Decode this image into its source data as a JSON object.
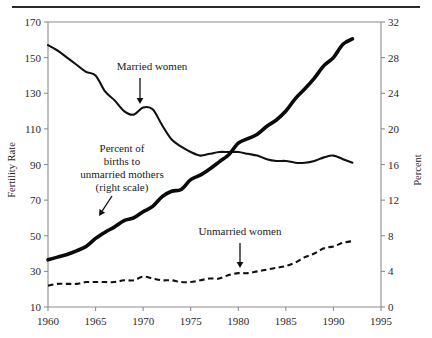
{
  "figure": {
    "top_rule": "horizontal-rule"
  },
  "chart_data": {
    "type": "line",
    "title": "",
    "xlabel": "",
    "ylabel": "Fertility Rate",
    "y2label": "Percent",
    "xlim": [
      1960,
      1995
    ],
    "ylim": [
      10,
      170
    ],
    "y2lim": [
      0,
      32
    ],
    "grid": false,
    "legend": "annotations-inline",
    "xticks": [
      1960,
      1965,
      1970,
      1975,
      1980,
      1985,
      1990,
      1995
    ],
    "yticks": [
      10,
      30,
      50,
      70,
      90,
      110,
      130,
      150,
      170
    ],
    "y2ticks": [
      0,
      4,
      8,
      12,
      16,
      20,
      24,
      28,
      32
    ],
    "series": [
      {
        "name": "Married women",
        "axis": "left",
        "style": "solid-thin",
        "x": [
          1960,
          1961,
          1962,
          1963,
          1964,
          1965,
          1966,
          1967,
          1968,
          1969,
          1970,
          1971,
          1972,
          1973,
          1974,
          1975,
          1976,
          1977,
          1978,
          1979,
          1980,
          1981,
          1982,
          1983,
          1984,
          1985,
          1986,
          1987,
          1988,
          1989,
          1990,
          1991,
          1992
        ],
        "values": [
          157,
          154,
          150,
          146,
          142,
          140,
          131,
          126,
          120,
          118,
          122,
          121,
          112,
          104,
          100,
          97,
          95,
          96,
          97,
          97,
          97,
          96,
          95,
          93,
          92,
          92,
          91,
          91,
          92,
          94,
          95,
          93,
          91
        ]
      },
      {
        "name": "Unmarried women",
        "axis": "left",
        "style": "dashed",
        "x": [
          1960,
          1961,
          1962,
          1963,
          1964,
          1965,
          1966,
          1967,
          1968,
          1969,
          1970,
          1971,
          1972,
          1973,
          1974,
          1975,
          1976,
          1977,
          1978,
          1979,
          1980,
          1981,
          1982,
          1983,
          1984,
          1985,
          1986,
          1987,
          1988,
          1989,
          1990,
          1991,
          1992
        ],
        "values": [
          22,
          23,
          23,
          23,
          24,
          24,
          24,
          24,
          25,
          25,
          27,
          26,
          25,
          25,
          24,
          24,
          25,
          26,
          26,
          28,
          29,
          29,
          30,
          31,
          32,
          33,
          35,
          38,
          40,
          43,
          44,
          46,
          47
        ]
      },
      {
        "name": "Percent of births to unmarried mothers (right scale)",
        "axis": "right",
        "style": "solid-thick",
        "x": [
          1960,
          1961,
          1962,
          1963,
          1964,
          1965,
          1966,
          1967,
          1968,
          1969,
          1970,
          1971,
          1972,
          1973,
          1974,
          1975,
          1976,
          1977,
          1978,
          1979,
          1980,
          1981,
          1982,
          1983,
          1984,
          1985,
          1986,
          1987,
          1988,
          1989,
          1990,
          1991,
          1992
        ],
        "values": [
          5.3,
          5.6,
          5.9,
          6.3,
          6.8,
          7.7,
          8.4,
          9.0,
          9.7,
          10.0,
          10.7,
          11.3,
          12.4,
          13.0,
          13.2,
          14.3,
          14.8,
          15.5,
          16.3,
          17.1,
          18.4,
          18.9,
          19.4,
          20.3,
          21.0,
          22.0,
          23.4,
          24.5,
          25.7,
          27.1,
          28.0,
          29.5,
          30.1
        ]
      }
    ],
    "annotations": [
      {
        "id": "married-women",
        "lines": [
          "Married women"
        ],
        "text_x": 152,
        "text_y": 70,
        "arrow": {
          "x1": 140,
          "y1": 78,
          "x2": 140,
          "y2": 104
        }
      },
      {
        "id": "percent-unmarried-mothers",
        "lines": [
          "Percent of",
          "births to",
          "unmarried mothers",
          "(right scale)"
        ],
        "text_x": 122,
        "text_y": 152,
        "arrow": {
          "x1": 112,
          "y1": 196,
          "x2": 99,
          "y2": 216
        }
      },
      {
        "id": "unmarried-women",
        "lines": [
          "Unmarried women"
        ],
        "text_x": 240,
        "text_y": 235,
        "arrow": {
          "x1": 240,
          "y1": 243,
          "x2": 240,
          "y2": 268
        }
      }
    ]
  }
}
